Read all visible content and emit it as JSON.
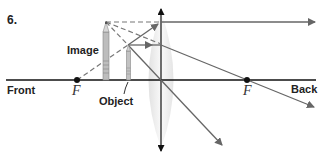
{
  "problem_number": "6.",
  "labels": {
    "image": "Image",
    "object": "Object",
    "front": "Front",
    "back": "Back",
    "focal_left": "F",
    "focal_right": "F"
  },
  "colors": {
    "axis": "#111111",
    "ray": "#666666",
    "dashed": "#777777",
    "lens": "#e6e6e6"
  }
}
